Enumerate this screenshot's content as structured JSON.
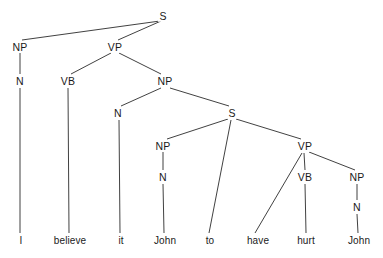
{
  "figure": {
    "sentence": "I believe it John to have hurt John",
    "width": 383,
    "height": 258,
    "background_color": "#ffffff",
    "line_color": "#2b2b2b",
    "text_color": "#1a1a1a"
  },
  "nodes": [
    {
      "id": "s-root",
      "label": "S",
      "x": 163,
      "y": 16
    },
    {
      "id": "np-subject",
      "label": "NP",
      "x": 20,
      "y": 47
    },
    {
      "id": "vp-main",
      "label": "VP",
      "x": 115,
      "y": 47
    },
    {
      "id": "n-i",
      "label": "N",
      "x": 20,
      "y": 81
    },
    {
      "id": "vb-believe",
      "label": "VB",
      "x": 68,
      "y": 81
    },
    {
      "id": "np-object",
      "label": "NP",
      "x": 165,
      "y": 81
    },
    {
      "id": "n-it",
      "label": "N",
      "x": 118,
      "y": 113
    },
    {
      "id": "s-embedded",
      "label": "S",
      "x": 232,
      "y": 113
    },
    {
      "id": "np-john1",
      "label": "NP",
      "x": 163,
      "y": 146
    },
    {
      "id": "vp-embedded",
      "label": "VP",
      "x": 305,
      "y": 146
    },
    {
      "id": "n-john1",
      "label": "N",
      "x": 163,
      "y": 177
    },
    {
      "id": "vb-hurt",
      "label": "VB",
      "x": 305,
      "y": 177
    },
    {
      "id": "np-john2",
      "label": "NP",
      "x": 357,
      "y": 177
    },
    {
      "id": "n-john2",
      "label": "N",
      "x": 357,
      "y": 207
    }
  ],
  "terminals": [
    {
      "id": "word-i",
      "label": "I",
      "x": 21,
      "y": 241
    },
    {
      "id": "word-believe",
      "label": "believe",
      "x": 70,
      "y": 241
    },
    {
      "id": "word-it",
      "label": "it",
      "x": 121,
      "y": 241
    },
    {
      "id": "word-john1",
      "label": "John",
      "x": 165,
      "y": 241
    },
    {
      "id": "word-to",
      "label": "to",
      "x": 210,
      "y": 241
    },
    {
      "id": "word-have",
      "label": "have",
      "x": 258,
      "y": 241
    },
    {
      "id": "word-hurt",
      "label": "hurt",
      "x": 306,
      "y": 241
    },
    {
      "id": "word-john2",
      "label": "John",
      "x": 359,
      "y": 241
    }
  ],
  "edges": [
    {
      "id": "e-s-np",
      "from": "s-root",
      "to": "np-subject",
      "x1": 160,
      "y1": 21,
      "x2": 22,
      "y2": 40
    },
    {
      "id": "e-s-vp",
      "from": "s-root",
      "to": "vp-main",
      "x1": 161,
      "y1": 21,
      "x2": 118,
      "y2": 40
    },
    {
      "id": "e-np-n",
      "from": "np-subject",
      "to": "n-i",
      "x1": 20,
      "y1": 53,
      "x2": 20,
      "y2": 74
    },
    {
      "id": "e-vp-vb",
      "from": "vp-main",
      "to": "vb-believe",
      "x1": 111,
      "y1": 53,
      "x2": 71,
      "y2": 74
    },
    {
      "id": "e-vp-np",
      "from": "vp-main",
      "to": "np-object",
      "x1": 119,
      "y1": 53,
      "x2": 161,
      "y2": 74
    },
    {
      "id": "e-n-i-word",
      "from": "n-i",
      "to": "word-i",
      "x1": 20,
      "y1": 88,
      "x2": 20,
      "y2": 233
    },
    {
      "id": "e-vb-believe",
      "from": "vb-believe",
      "to": "word-believe",
      "x1": 68,
      "y1": 88,
      "x2": 69,
      "y2": 233
    },
    {
      "id": "e-np-n-it",
      "from": "np-object",
      "to": "n-it",
      "x1": 161,
      "y1": 88,
      "x2": 121,
      "y2": 106
    },
    {
      "id": "e-np-s",
      "from": "np-object",
      "to": "s-embedded",
      "x1": 170,
      "y1": 88,
      "x2": 229,
      "y2": 106
    },
    {
      "id": "e-n-it-word",
      "from": "n-it",
      "to": "word-it",
      "x1": 119,
      "y1": 120,
      "x2": 120,
      "y2": 233
    },
    {
      "id": "e-s-np-john",
      "from": "s-embedded",
      "to": "np-john1",
      "x1": 228,
      "y1": 119,
      "x2": 167,
      "y2": 139
    },
    {
      "id": "e-s-to",
      "from": "s-embedded",
      "to": "word-to",
      "x1": 231,
      "y1": 120,
      "x2": 209,
      "y2": 233
    },
    {
      "id": "e-s-vp-emb",
      "from": "s-embedded",
      "to": "vp-embedded",
      "x1": 236,
      "y1": 119,
      "x2": 301,
      "y2": 139
    },
    {
      "id": "e-np-n-john1",
      "from": "np-john1",
      "to": "n-john1",
      "x1": 163,
      "y1": 152,
      "x2": 163,
      "y2": 170
    },
    {
      "id": "e-n-john1-word",
      "from": "n-john1",
      "to": "word-john1",
      "x1": 163,
      "y1": 184,
      "x2": 164,
      "y2": 233
    },
    {
      "id": "e-vp-have",
      "from": "vp-embedded",
      "to": "word-have",
      "x1": 302,
      "y1": 153,
      "x2": 255,
      "y2": 233
    },
    {
      "id": "e-vp-vb-hurt",
      "from": "vp-embedded",
      "to": "vb-hurt",
      "x1": 304,
      "y1": 153,
      "x2": 305,
      "y2": 170
    },
    {
      "id": "e-vp-np-john2",
      "from": "vp-embedded",
      "to": "np-john2",
      "x1": 309,
      "y1": 152,
      "x2": 355,
      "y2": 170
    },
    {
      "id": "e-vb-hurt-word",
      "from": "vb-hurt",
      "to": "word-hurt",
      "x1": 305,
      "y1": 184,
      "x2": 306,
      "y2": 233
    },
    {
      "id": "e-np-n-john2",
      "from": "np-john2",
      "to": "n-john2",
      "x1": 357,
      "y1": 184,
      "x2": 357,
      "y2": 200
    },
    {
      "id": "e-n-john2-word",
      "from": "n-john2",
      "to": "word-john2",
      "x1": 357,
      "y1": 214,
      "x2": 358,
      "y2": 233
    }
  ]
}
